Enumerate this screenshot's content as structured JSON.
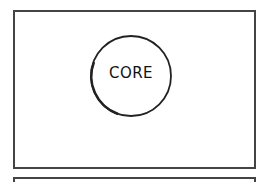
{
  "diagram": {
    "core_label": "CORE",
    "colors": {
      "stroke": "#222222",
      "frame": "#444444",
      "background": "#ffffff"
    }
  }
}
